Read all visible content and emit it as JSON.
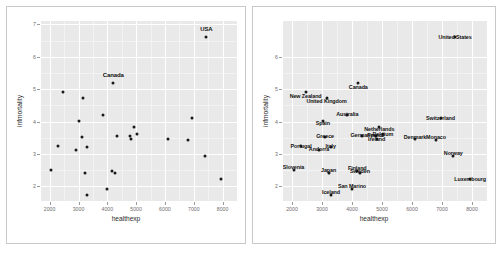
{
  "figure": {
    "panel_background": "#e9e9e9",
    "gridline_color": "#ffffff",
    "point_color": "#1a1a1a",
    "frame_color": "#c9c9c9"
  },
  "panels": [
    {
      "id": "left",
      "name": "scatter-plot-labeled-extremes",
      "axes": {
        "xlabel": "healthexp",
        "ylabel": "infmortality",
        "xticks": [
          "2000",
          "3000",
          "4000",
          "5000",
          "6000",
          "7000",
          "8000"
        ],
        "yticks": [
          "2",
          "3",
          "4",
          "5",
          "6",
          "7"
        ],
        "xlim": [
          1700,
          8500
        ],
        "ylim": [
          1.55,
          7.1
        ]
      },
      "labels": [
        {
          "text": "USA",
          "x": 7437,
          "y": 6.85
        },
        {
          "text": "Canada",
          "x": 4209,
          "y": 5.45
        }
      ]
    },
    {
      "id": "right",
      "name": "scatter-plot-all-labeled",
      "axes": {
        "xlabel": "healthexp",
        "ylabel": "infmortality",
        "xticks": [
          "2000",
          "3000",
          "4000",
          "5000",
          "6000",
          "7000",
          "8000"
        ],
        "yticks": [
          "2",
          "3",
          "4",
          "5",
          "6"
        ],
        "xlim": [
          1700,
          8500
        ],
        "ylim": [
          1.55,
          7.1
        ]
      },
      "labels": [
        {
          "text": "United States",
          "x": 7437,
          "y": 6.6
        },
        {
          "text": "Canada",
          "x": 4209,
          "y": 5.08
        },
        {
          "text": "New Zealand",
          "x": 2454,
          "y": 4.78
        },
        {
          "text": "United Kingdom",
          "x": 3149,
          "y": 4.62
        },
        {
          "text": "Australia",
          "x": 3845,
          "y": 4.23
        },
        {
          "text": "Spain",
          "x": 3027,
          "y": 3.95
        },
        {
          "text": "Switzerland",
          "x": 6950,
          "y": 4.12
        },
        {
          "text": "Netherlands",
          "x": 4910,
          "y": 3.76
        },
        {
          "text": "Belgium",
          "x": 5025,
          "y": 3.62
        },
        {
          "text": "Germany",
          "x": 4327,
          "y": 3.58
        },
        {
          "text": "France",
          "x": 4798,
          "y": 3.59
        },
        {
          "text": "Ireland",
          "x": 4820,
          "y": 3.47
        },
        {
          "text": "Greece",
          "x": 3105,
          "y": 3.55
        },
        {
          "text": "Denmark",
          "x": 6100,
          "y": 3.51
        },
        {
          "text": "Monaco",
          "x": 6800,
          "y": 3.51
        },
        {
          "text": "Portugal",
          "x": 2300,
          "y": 3.24
        },
        {
          "text": "Andorra",
          "x": 2900,
          "y": 3.17
        },
        {
          "text": "Italy",
          "x": 3290,
          "y": 3.24
        },
        {
          "text": "Norway",
          "x": 7375,
          "y": 3.02
        },
        {
          "text": "Slovenia",
          "x": 2050,
          "y": 2.6
        },
        {
          "text": "Japan",
          "x": 3221,
          "y": 2.5
        },
        {
          "text": "Finland",
          "x": 4178,
          "y": 2.56
        },
        {
          "text": "Sweden",
          "x": 4265,
          "y": 2.48
        },
        {
          "text": "Luxembourg",
          "x": 7940,
          "y": 2.23
        },
        {
          "text": "San Marino",
          "x": 4000,
          "y": 2.0
        },
        {
          "text": "Iceland",
          "x": 3300,
          "y": 1.83
        }
      ]
    }
  ],
  "chart_data": {
    "type": "scatter",
    "title": "",
    "xlabel": "healthexp",
    "ylabel": "infmortality",
    "xlim": [
      1700,
      8500
    ],
    "ylim": [
      1.55,
      7.1
    ],
    "grid": true,
    "legend": "none",
    "points": [
      {
        "label": "United States",
        "x": 7437,
        "y": 6.6
      },
      {
        "label": "Canada",
        "x": 4209,
        "y": 5.2
      },
      {
        "label": "New Zealand",
        "x": 2454,
        "y": 4.92
      },
      {
        "label": "United Kingdom",
        "x": 3149,
        "y": 4.73
      },
      {
        "label": "Australia",
        "x": 3845,
        "y": 4.21
      },
      {
        "label": "Switzerland",
        "x": 6950,
        "y": 4.12
      },
      {
        "label": "Spain",
        "x": 3027,
        "y": 4.01
      },
      {
        "label": "Netherlands",
        "x": 4910,
        "y": 3.84
      },
      {
        "label": "Belgium",
        "x": 5025,
        "y": 3.61
      },
      {
        "label": "Germany",
        "x": 4327,
        "y": 3.55
      },
      {
        "label": "France",
        "x": 4798,
        "y": 3.57
      },
      {
        "label": "Ireland",
        "x": 4820,
        "y": 3.47
      },
      {
        "label": "Greece",
        "x": 3105,
        "y": 3.51
      },
      {
        "label": "Denmark",
        "x": 6100,
        "y": 3.45
      },
      {
        "label": "Monaco",
        "x": 6800,
        "y": 3.44
      },
      {
        "label": "Portugal",
        "x": 2300,
        "y": 3.24
      },
      {
        "label": "Andorra",
        "x": 2900,
        "y": 3.11
      },
      {
        "label": "Italy",
        "x": 3290,
        "y": 3.23
      },
      {
        "label": "Norway",
        "x": 7375,
        "y": 2.94
      },
      {
        "label": "Slovenia",
        "x": 2050,
        "y": 2.52
      },
      {
        "label": "Japan",
        "x": 3221,
        "y": 2.41
      },
      {
        "label": "Finland",
        "x": 4178,
        "y": 2.49
      },
      {
        "label": "Sweden",
        "x": 4265,
        "y": 2.42
      },
      {
        "label": "Luxembourg",
        "x": 7940,
        "y": 2.23
      },
      {
        "label": "San Marino",
        "x": 4000,
        "y": 1.92
      },
      {
        "label": "Iceland",
        "x": 3300,
        "y": 1.73
      }
    ]
  }
}
